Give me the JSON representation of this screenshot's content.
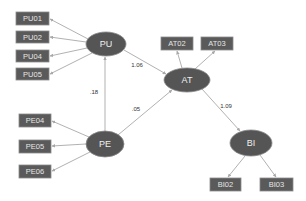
{
  "diagram": {
    "type": "structural-equation-model",
    "colors": {
      "node_fill": "#555555",
      "indicator_fill": "#5a5a5a",
      "edge": "#a8a8a8",
      "label_text": "#333333"
    },
    "latent": {
      "PU": {
        "label": "PU",
        "cx": 106,
        "cy": 44,
        "rx": 20,
        "ry": 12
      },
      "AT": {
        "label": "AT",
        "cx": 187,
        "cy": 80,
        "rx": 23,
        "ry": 12
      },
      "PE": {
        "label": "PE",
        "cx": 105,
        "cy": 144,
        "rx": 19,
        "ry": 13
      },
      "BI": {
        "label": "BI",
        "cx": 251,
        "cy": 143,
        "rx": 21,
        "ry": 13
      }
    },
    "indicators": {
      "PU01": {
        "label": "PU01",
        "x": 16,
        "y": 12,
        "w": 33,
        "h": 13
      },
      "PU02": {
        "label": "PU02",
        "x": 16,
        "y": 31,
        "w": 33,
        "h": 12
      },
      "PU04": {
        "label": "PU04",
        "x": 16,
        "y": 50,
        "w": 33,
        "h": 12
      },
      "PU05": {
        "label": "PU05",
        "x": 16,
        "y": 68,
        "w": 33,
        "h": 12
      },
      "AT02": {
        "label": "AT02",
        "x": 161,
        "y": 37,
        "w": 32,
        "h": 13
      },
      "AT03": {
        "label": "AT03",
        "x": 201,
        "y": 37,
        "w": 32,
        "h": 13
      },
      "PE04": {
        "label": "PE04",
        "x": 19,
        "y": 114,
        "w": 32,
        "h": 13
      },
      "PE05": {
        "label": "PE05",
        "x": 19,
        "y": 140,
        "w": 32,
        "h": 13
      },
      "PE06": {
        "label": "PE06",
        "x": 19,
        "y": 165,
        "w": 32,
        "h": 13
      },
      "BI02": {
        "label": "BI02",
        "x": 210,
        "y": 178,
        "w": 31,
        "h": 13
      },
      "BI03": {
        "label": "BI03",
        "x": 260,
        "y": 178,
        "w": 33,
        "h": 13
      }
    },
    "paths": [
      {
        "from": "PU",
        "to": "AT",
        "coefficient": "1.06",
        "lx": 137,
        "ly": 65
      },
      {
        "from": "PE",
        "to": "PU",
        "coefficient": ".18",
        "lx": 94,
        "ly": 92
      },
      {
        "from": "PE",
        "to": "AT",
        "coefficient": ".05",
        "lx": 136,
        "ly": 109
      },
      {
        "from": "AT",
        "to": "BI",
        "coefficient": "1.09",
        "lx": 226,
        "ly": 106
      }
    ],
    "measurement": [
      {
        "latent": "PU",
        "indicator": "PU01"
      },
      {
        "latent": "PU",
        "indicator": "PU02"
      },
      {
        "latent": "PU",
        "indicator": "PU04"
      },
      {
        "latent": "PU",
        "indicator": "PU05"
      },
      {
        "latent": "AT",
        "indicator": "AT02"
      },
      {
        "latent": "AT",
        "indicator": "AT03"
      },
      {
        "latent": "PE",
        "indicator": "PE04"
      },
      {
        "latent": "PE",
        "indicator": "PE05"
      },
      {
        "latent": "PE",
        "indicator": "PE06"
      },
      {
        "latent": "BI",
        "indicator": "BI02"
      },
      {
        "latent": "BI",
        "indicator": "BI03"
      }
    ]
  }
}
